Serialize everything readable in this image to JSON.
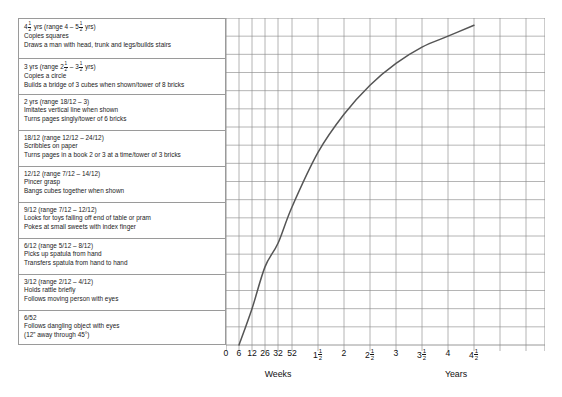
{
  "chart_data": {
    "type": "line",
    "title": "",
    "xlabel_left": "Weeks",
    "xlabel_right": "Years",
    "ylabel": "",
    "grid": true,
    "legend": "none",
    "x_tick_labels": [
      "0",
      "6",
      "12",
      "26",
      "32",
      "52",
      "1 1/2",
      "2",
      "2 1/2",
      "3",
      "3 1/2",
      "4",
      "4 1/2"
    ],
    "x_tick_units": [
      "weeks",
      "weeks",
      "weeks",
      "weeks",
      "weeks",
      "weeks",
      "years",
      "years",
      "years",
      "years",
      "years",
      "years",
      "years"
    ],
    "x_tick_px": [
      226,
      239,
      252,
      265,
      278,
      292,
      318,
      344,
      370,
      396,
      422,
      448,
      474
    ],
    "curve_description": "Developmental progress curve rising steeply from 6 weeks then flattening toward 4 1/2 years",
    "points": [
      {
        "x": "6",
        "y_level": 0
      },
      {
        "x": "12",
        "y_level": 2.0
      },
      {
        "x": "26",
        "y_level": 4.3
      },
      {
        "x": "32",
        "y_level": 5.6
      },
      {
        "x": "52",
        "y_level": 7.6
      },
      {
        "x": "1 1/2",
        "y_level": 10.6
      },
      {
        "x": "2",
        "y_level": 12.7
      },
      {
        "x": "2 1/2",
        "y_level": 14.3
      },
      {
        "x": "3",
        "y_level": 15.5
      },
      {
        "x": "3 1/2",
        "y_level": 16.4
      },
      {
        "x": "4",
        "y_level": 17.0
      },
      {
        "x": "4 1/2",
        "y_level": 17.6
      }
    ],
    "ylim": [
      0,
      18
    ],
    "xlim_px": [
      226,
      545
    ],
    "grid_rows": 18,
    "grid_cols": 13,
    "curve_color": "#555555",
    "grid_color": "#8c8c8c"
  },
  "milestones": [
    {
      "age": "4½ yrs (range 4 – 5½ yrs)",
      "age_parts": {
        "lead": "4",
        "frac1": "1/2",
        "mid": " yrs (range 4 – 5",
        "frac2": "1/2",
        "tail": " yrs)"
      },
      "lines": [
        "Copies squares",
        "Draws a man with head, trunk and legs/builds stairs"
      ]
    },
    {
      "age": "3 yrs (range 2½ – 3½ yrs)",
      "age_parts": {
        "lead": "3 yrs (range 2",
        "frac1": "1/2",
        "mid": " – 3",
        "frac2": "1/2",
        "tail": " yrs)"
      },
      "lines": [
        "Copies a circle",
        "Builds a bridge of 3 cubes when shown/tower of 8 bricks"
      ]
    },
    {
      "age": "2 yrs (range 18/12 – 3)",
      "lines": [
        "Imitates vertical line when shown",
        "Turns pages singly/tower of 6 bricks"
      ]
    },
    {
      "age": "18/12 (range 12/12 – 24/12)",
      "lines": [
        "Scribbles on paper",
        "Turns pages in a book 2 or 3 at a time/tower of 3 bricks"
      ]
    },
    {
      "age": "12/12 (range 7/12 – 14/12)",
      "lines": [
        "Pincer grasp",
        "Bangs cubes together when shown"
      ]
    },
    {
      "age": "9/12 (range 7/12 – 12/12)",
      "lines": [
        "Looks for toys falling off end of table or pram",
        "Pokes at small sweets with index finger"
      ]
    },
    {
      "age": "6/12 (range 5/12 – 8/12)",
      "lines": [
        "Picks up spatula from hand",
        "Transfers spatula from hand to hand"
      ]
    },
    {
      "age": "3/12 (range 2/12 – 4/12)",
      "lines": [
        "Holds rattle briefly",
        "Follows moving person with eyes"
      ]
    },
    {
      "age": "6/52",
      "lines": [
        "Follows dangling object with eyes",
        "(12” away through 45°)"
      ]
    }
  ]
}
